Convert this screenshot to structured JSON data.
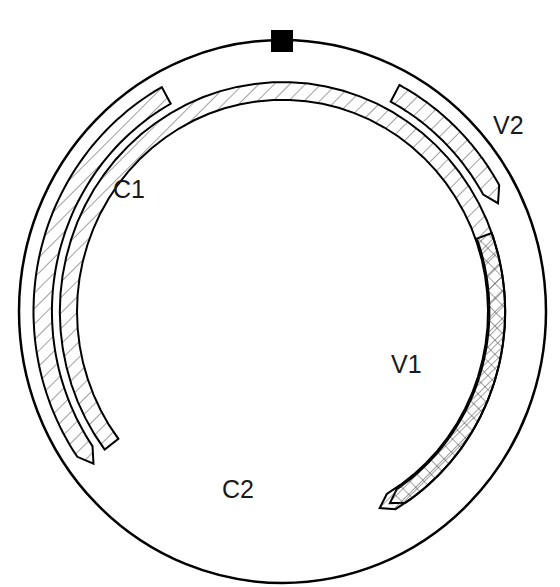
{
  "diagram": {
    "type": "circular-genome-map",
    "canvas": {
      "width": 560,
      "height": 587
    },
    "genome_circle": {
      "cx": 282.5,
      "cy": 311.5,
      "rx": 263.5,
      "ry": 271.5,
      "stroke": "#000000",
      "stroke_width": 2.5
    },
    "origin_marker": {
      "shape": "filled-square",
      "x": 271,
      "y": 30,
      "size": 22,
      "color": "#000000"
    },
    "orfs": [
      {
        "name": "V2",
        "strand": "virion-sense",
        "direction": "clockwise",
        "fill": "diagonal-hatch",
        "start_deg": 28,
        "end_deg": 64,
        "r_outer": 0.945,
        "r_inner": 0.875,
        "arrow": "end",
        "label": {
          "text": "V2",
          "x": 493,
          "y": 113
        }
      },
      {
        "name": "V1",
        "strand": "virion-sense",
        "direction": "clockwise",
        "fill": "cross-hatch",
        "start_deg": 70,
        "end_deg": 150,
        "r_outer": 0.845,
        "r_inner": 0.785,
        "arrow": "end",
        "label": {
          "text": "V1",
          "x": 391,
          "y": 352
        }
      },
      {
        "name": "C1",
        "strand": "complementary-sense",
        "direction": "counter-clockwise",
        "fill": "diagonal-hatch",
        "start_deg": 331,
        "end_deg": 232,
        "r_outer": 0.945,
        "r_inner": 0.875,
        "arrow": "end",
        "label": {
          "text": "C1",
          "x": 113,
          "y": 177
        }
      },
      {
        "name": "C2",
        "strand": "complementary-sense",
        "direction": "counter-clockwise",
        "fill": "diagonal-hatch",
        "start_deg": 153,
        "end_deg": 233,
        "r_outer": 0.845,
        "r_inner": 0.78,
        "arrow": "start",
        "label": {
          "text": "C2",
          "x": 222,
          "y": 477
        }
      }
    ],
    "labels": {
      "v2": "V2",
      "v1": "V1",
      "c1": "C1",
      "c2": "C2"
    }
  }
}
